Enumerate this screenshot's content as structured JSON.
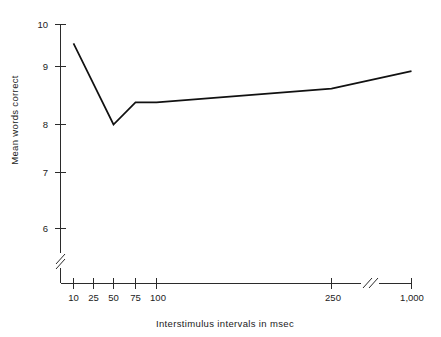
{
  "chart_data": {
    "type": "line",
    "title": "",
    "subtitle": "",
    "xlabel": "Interstimulus intervals in msec",
    "ylabel": "Mean words correct",
    "grid": false,
    "legend": false,
    "legend_position": "none",
    "x_scale": "ordinal-broken",
    "x_axis_break": {
      "between": [
        250,
        1000
      ],
      "symbol": "//"
    },
    "y_axis_break": {
      "below": 6,
      "symbol": "//"
    },
    "xlim": [
      10,
      1000
    ],
    "ylim": [
      5.6,
      10
    ],
    "x_tick_labels": [
      "10",
      "25",
      "50",
      "75",
      "100",
      "250",
      "1,000"
    ],
    "x_tick_values": [
      10,
      25,
      50,
      75,
      100,
      250,
      1000
    ],
    "y_tick_labels": [
      "6",
      "7",
      "8",
      "9",
      "10"
    ],
    "y_tick_values": [
      6,
      7,
      8,
      9,
      10
    ],
    "series": [
      {
        "name": "Mean words correct",
        "color": "#111111",
        "x": [
          10,
          50,
          75,
          100,
          250,
          1000
        ],
        "values": [
          9.55,
          8.0,
          8.38,
          8.38,
          8.62,
          8.92
        ]
      }
    ],
    "points": [
      {
        "x_label": "10",
        "x": 10,
        "y": 9.55
      },
      {
        "x_label": "50",
        "x": 50,
        "y": 8.0
      },
      {
        "x_label": "75",
        "x": 75,
        "y": 8.38
      },
      {
        "x_label": "100",
        "x": 100,
        "y": 8.38
      },
      {
        "x_label": "250",
        "x": 250,
        "y": 8.62
      },
      {
        "x_label": "1,000",
        "x": 1000,
        "y": 8.92
      }
    ]
  },
  "axes": {
    "y_title": "Mean words correct",
    "x_title": "Interstimulus intervals in msec",
    "y_ticks": [
      {
        "label": "10"
      },
      {
        "label": "9"
      },
      {
        "label": "8"
      },
      {
        "label": "7"
      },
      {
        "label": "6"
      }
    ],
    "x_ticks": [
      {
        "label": "10"
      },
      {
        "label": "25"
      },
      {
        "label": "50"
      },
      {
        "label": "75"
      },
      {
        "label": "100"
      },
      {
        "label": "250"
      },
      {
        "label": "1,000"
      }
    ]
  },
  "colors": {
    "line": "#111111",
    "axis": "#2b2b2b",
    "text": "#1a1a1a",
    "background": "#ffffff"
  }
}
